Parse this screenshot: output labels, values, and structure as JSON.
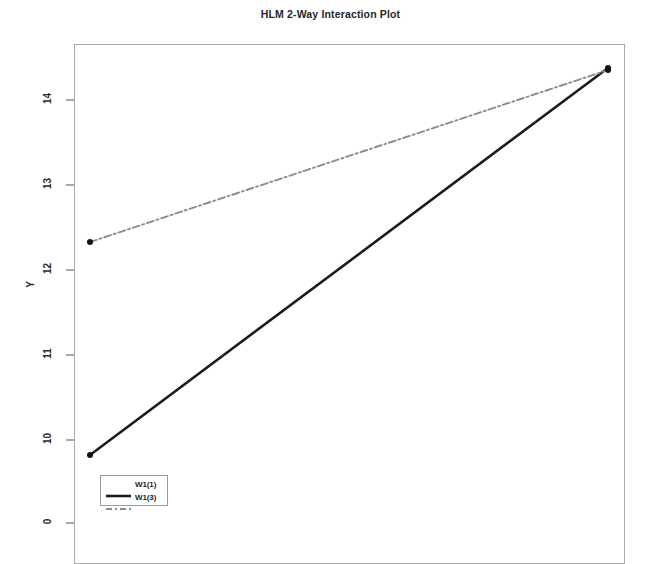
{
  "chart_data": {
    "type": "line",
    "title": "HLM 2-Way Interaction Plot",
    "xlabel": "",
    "ylabel": "Y",
    "grid": false,
    "legend_position": "bottom-left",
    "x": [
      1,
      2
    ],
    "xlim": [
      0.72,
      2.12
    ],
    "yticks": [
      "0",
      "10",
      "11",
      "12",
      "13",
      "14"
    ],
    "ylim_visible": [
      9.0,
      14.75
    ],
    "axis_break": true,
    "series": [
      {
        "name": "W1(1)",
        "style": "solid",
        "color": "#1c1c1c",
        "values": [
          9.82,
          14.38
        ],
        "markers": true
      },
      {
        "name": "W1(3)",
        "style": "dash-dot",
        "color": "#8c8c8c",
        "values": [
          12.33,
          14.35
        ],
        "markers": true
      }
    ]
  },
  "axis": {
    "y_title": "Y",
    "ticks": [
      {
        "label": "14",
        "y": 100
      },
      {
        "label": "13",
        "y": 185
      },
      {
        "label": "12",
        "y": 270
      },
      {
        "label": "11",
        "y": 355
      },
      {
        "label": "10",
        "y": 440
      },
      {
        "label": "0",
        "y": 523
      }
    ]
  },
  "legend": {
    "items": [
      {
        "label": "W1(1)",
        "style": "solid"
      },
      {
        "label": "W1(3)",
        "style": "dash-dot"
      }
    ]
  },
  "geometry": {
    "series_points": [
      {
        "x1": 90,
        "y1": 455,
        "x2": 608,
        "y2": 68
      },
      {
        "x1": 90,
        "y1": 242,
        "x2": 608,
        "y2": 70
      }
    ]
  }
}
